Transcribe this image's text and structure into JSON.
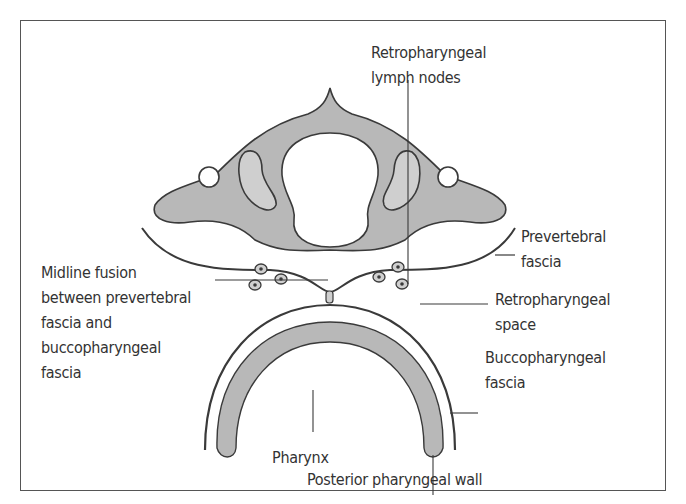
{
  "figure": {
    "type": "anatomical cross-section diagram",
    "colors": {
      "bone_fill": "#b8b8b8",
      "inner_light_fill": "#cfcfcf",
      "outline": "#3a3a3a",
      "frame": "#555555",
      "text": "#333333",
      "background": "#ffffff"
    }
  },
  "labels": {
    "retropharyngeal_lymph_nodes": "Retropharyngeal\nlymph nodes",
    "prevertebral_fascia": "Prevertebral\nfascia",
    "midline_fusion": "Midline fusion\nbetween prevertebral\nfascia and\nbuccopharyngeal\nfascia",
    "retropharyngeal_space": "Retropharyngeal\nspace",
    "buccopharyngeal_fascia": "Buccopharyngeal\nfascia",
    "pharynx": "Pharynx",
    "posterior_pharyngeal_wall": "Posterior pharyngeal wall"
  }
}
